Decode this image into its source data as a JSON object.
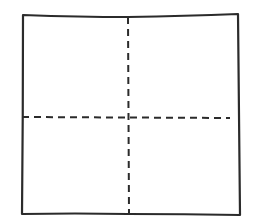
{
  "diagram": {
    "type": "quadrant-square",
    "stroke_color": "#2b2b2b",
    "background": "#ffffff",
    "outline": {
      "points": [
        [
          23,
          15
        ],
        [
          128,
          17
        ],
        [
          238,
          14
        ],
        [
          240,
          215
        ],
        [
          128,
          214
        ],
        [
          22,
          214
        ]
      ],
      "stroke_width": 2.2
    },
    "vertical_divider": {
      "x1": 128,
      "y1": 17,
      "x2": 129,
      "y2": 214,
      "style": "dashed",
      "stroke_width": 2
    },
    "horizontal_divider": {
      "x1": 22,
      "y1": 117,
      "x2": 230,
      "y2": 118,
      "style": "dashed",
      "stroke_width": 2
    },
    "quadrants": [
      {
        "name": "top-left"
      },
      {
        "name": "top-right"
      },
      {
        "name": "bottom-left"
      },
      {
        "name": "bottom-right"
      }
    ]
  }
}
